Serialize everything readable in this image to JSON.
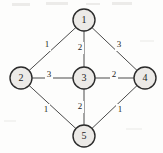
{
  "diagram": {
    "type": "weighted-graph",
    "canvas": {
      "width": 163,
      "height": 153
    },
    "style": {
      "node_fill": "#eceae7",
      "node_stroke": "#2b2b2b",
      "edge_stroke": "#4a4a4a",
      "label_color": "#1e1e1e",
      "background": "#fdfdfc"
    },
    "nodes": [
      {
        "id": "1",
        "label": "1",
        "x": 84,
        "y": 20,
        "r": 11
      },
      {
        "id": "2",
        "label": "2",
        "x": 21,
        "y": 78,
        "r": 11
      },
      {
        "id": "3",
        "label": "3",
        "x": 84,
        "y": 78,
        "r": 11
      },
      {
        "id": "4",
        "label": "4",
        "x": 145,
        "y": 78,
        "r": 11
      },
      {
        "id": "5",
        "label": "5",
        "x": 84,
        "y": 136,
        "r": 11
      }
    ],
    "edges": [
      {
        "from": "1",
        "to": "2",
        "weight": "1",
        "label_x": 47,
        "label_y": 45
      },
      {
        "from": "1",
        "to": "3",
        "weight": "2",
        "label_x": 80,
        "label_y": 48
      },
      {
        "from": "1",
        "to": "4",
        "weight": "3",
        "label_x": 119,
        "label_y": 45
      },
      {
        "from": "2",
        "to": "3",
        "weight": "3",
        "label_x": 49,
        "label_y": 75
      },
      {
        "from": "3",
        "to": "4",
        "weight": "2",
        "label_x": 114,
        "label_y": 75
      },
      {
        "from": "2",
        "to": "5",
        "weight": "1",
        "label_x": 46,
        "label_y": 110
      },
      {
        "from": "3",
        "to": "5",
        "weight": "2",
        "label_x": 80,
        "label_y": 107
      },
      {
        "from": "4",
        "to": "5",
        "weight": "1",
        "label_x": 120,
        "label_y": 110
      }
    ]
  }
}
